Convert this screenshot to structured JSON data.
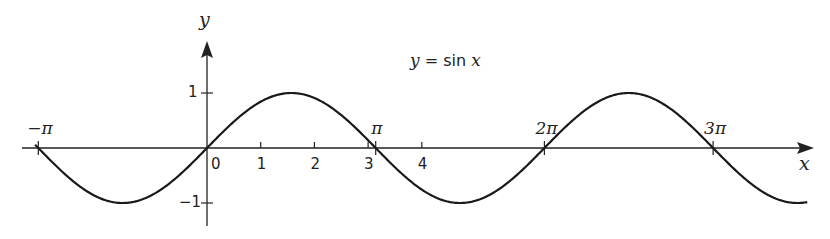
{
  "chart_data": {
    "type": "line",
    "title": "y = sin x",
    "title_parts": {
      "lhs": "y",
      "eq": " = ",
      "fn": "sin ",
      "arg": "x"
    },
    "xlabel": "x",
    "ylabel": "y",
    "function": "sin(x)",
    "xlim": [
      -3.14159,
      11.3
    ],
    "ylim": [
      -1,
      1
    ],
    "grid": false,
    "legend": null,
    "x_ticks_numeric": [
      {
        "value": 0,
        "label": "0"
      },
      {
        "value": 1,
        "label": "1"
      },
      {
        "value": 2,
        "label": "2"
      },
      {
        "value": 3,
        "label": "3"
      },
      {
        "value": 4,
        "label": "4"
      }
    ],
    "x_ticks_pi": [
      {
        "value": -3.14159,
        "label": "−π"
      },
      {
        "value": 3.14159,
        "label": "π"
      },
      {
        "value": 6.28319,
        "label": "2π"
      },
      {
        "value": 9.42478,
        "label": "3π"
      }
    ],
    "y_ticks": [
      {
        "value": 1,
        "label": "1"
      },
      {
        "value": -1,
        "label": "−1"
      }
    ],
    "series": [
      {
        "name": "y = sin x",
        "x": [
          -3.1416,
          -2.3562,
          -1.5708,
          -0.7854,
          0,
          0.7854,
          1.5708,
          2.3562,
          3.1416,
          3.927,
          4.7124,
          5.4978,
          6.2832,
          7.0686,
          7.854,
          8.6394,
          9.4248,
          10.2102,
          10.9956
        ],
        "y": [
          0,
          -0.7071,
          -1,
          -0.7071,
          0,
          0.7071,
          1,
          0.7071,
          0,
          -0.7071,
          -1,
          -0.7071,
          0,
          0.7071,
          1,
          0.7071,
          0,
          -0.7071,
          -1
        ]
      }
    ],
    "stroke_color": "#1a1a1a"
  }
}
